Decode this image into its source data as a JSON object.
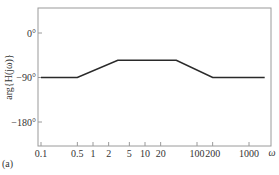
{
  "chart_data": {
    "type": "line",
    "title": "",
    "panel_label": "(a)",
    "xlabel": "ω",
    "ylabel": "arg{H(jω)}",
    "x_scale": "log",
    "x_ticks": [
      0.1,
      0.5,
      1,
      2,
      5,
      10,
      20,
      100,
      200,
      1000
    ],
    "x_tick_labels": [
      "0.1",
      "0.5",
      "1",
      "2",
      "5",
      "10",
      "20",
      "100",
      "200",
      "1000"
    ],
    "y_ticks": [
      0,
      -90,
      -180
    ],
    "y_tick_labels": [
      "0°",
      "−90°",
      "−180°"
    ],
    "xlim": [
      0.1,
      2000
    ],
    "ylim": [
      -230,
      50
    ],
    "grid": false,
    "legend": null,
    "series": [
      {
        "name": "phase",
        "x": [
          0.1,
          0.5,
          3,
          40,
          200,
          2000
        ],
        "y": [
          -90,
          -90,
          -55,
          -55,
          -90,
          -90
        ]
      }
    ],
    "colors": {
      "line": "#2a2a2a",
      "frame": "#9a9a9a"
    }
  }
}
